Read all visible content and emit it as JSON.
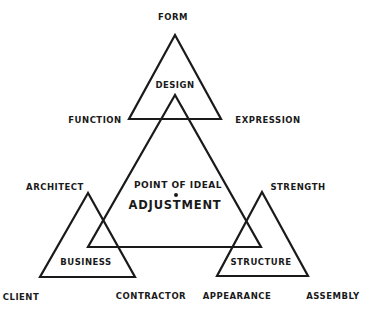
{
  "diagram": {
    "center": {
      "line1": "POINT OF IDEAL",
      "line2": "ADJUSTMENT"
    },
    "triangles": [
      {
        "name": "DESIGN",
        "apex_label": "FORM",
        "left_label": "FUNCTION",
        "right_label": "EXPRESSION"
      },
      {
        "name": "BUSINESS",
        "apex_label": "ARCHITECT",
        "left_label": "CLIENT",
        "right_label": "CONTRACTOR"
      },
      {
        "name": "STRUCTURE",
        "apex_label": "STRENGTH",
        "left_label": "APPEARANCE",
        "right_label": "ASSEMBLY"
      }
    ],
    "line_color": "#1a1a1a",
    "background": "#ffffff"
  }
}
